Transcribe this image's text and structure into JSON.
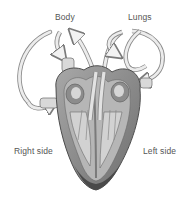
{
  "diagram": {
    "labels": {
      "body": "Body",
      "lungs": "Lungs",
      "right_side": "Right side",
      "left_side": "Left side"
    },
    "colors": {
      "background": "#ffffff",
      "label_text": "#555555",
      "vessel_light": "#e6e6e6",
      "vessel_outline": "#8a8a8a",
      "heart_muscle": "#9a9a9a",
      "heart_wall_dark": "#5e5e5e",
      "chamber_light": "#cfcfcf"
    },
    "flows": [
      {
        "from": "Body",
        "to": "Right side",
        "description": "arrows from body into right atrium"
      },
      {
        "from": "Right side",
        "to": "Lungs",
        "description": "pulmonary artery arrows up to lungs"
      },
      {
        "from": "Lungs",
        "to": "Left side",
        "description": "pulmonary veins returning to left atrium"
      },
      {
        "from": "Left side",
        "to": "Body",
        "description": "aorta arrow up to body"
      }
    ]
  }
}
